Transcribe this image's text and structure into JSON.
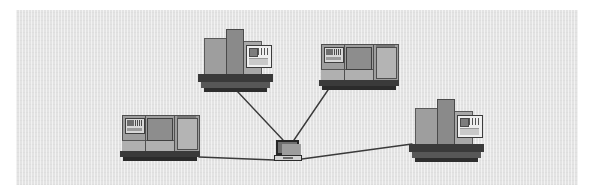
{
  "canvas": {
    "width": 592,
    "height": 195,
    "background_color": "#ffffff",
    "panel": {
      "x": 16,
      "y": 10,
      "width": 562,
      "height": 175,
      "fill_color": "#e3e3e3",
      "texture": "fine-vertical-hatch"
    }
  },
  "diagram": {
    "title": "",
    "type": "star-network",
    "hub_name": "laptop-hub",
    "link_color": "#3a3a3a",
    "link_width": 1.4,
    "node_count": 5,
    "link_count": 4
  },
  "nodes": [
    {
      "id": "machine-top-left",
      "kind": "vertical-machining-center",
      "orientation": "front",
      "x": 198,
      "y": 27,
      "width": 75,
      "height": 66,
      "body_color": "#9e9e9e",
      "column_color": "#8a8a8a",
      "panel_color": "#efefef",
      "base_color": "#3a3a3a"
    },
    {
      "id": "machine-top-right",
      "kind": "cnc-lathe",
      "orientation": "front",
      "x": 319,
      "y": 43,
      "width": 80,
      "height": 48,
      "body_color": "#9e9e9e",
      "window_color": "#8d8d8d",
      "panel_color": "#d8d8d8",
      "base_color": "#3a3a3a"
    },
    {
      "id": "machine-bottom-left",
      "kind": "cnc-lathe",
      "orientation": "front",
      "x": 120,
      "y": 114,
      "width": 80,
      "height": 48,
      "body_color": "#9e9e9e",
      "window_color": "#8d8d8d",
      "panel_color": "#d8d8d8",
      "base_color": "#3a3a3a"
    },
    {
      "id": "machine-bottom-right",
      "kind": "vertical-machining-center",
      "orientation": "front",
      "x": 409,
      "y": 97,
      "width": 75,
      "height": 66,
      "body_color": "#9e9e9e",
      "column_color": "#8a8a8a",
      "panel_color": "#efefef",
      "base_color": "#3a3a3a"
    },
    {
      "id": "laptop-hub",
      "kind": "laptop",
      "x": 274,
      "y": 140,
      "width": 28,
      "height": 22,
      "lid_color": "#6f6f6f",
      "screen_color": "#9d9d9d",
      "deck_color": "#d2d2d2"
    }
  ],
  "links": [
    {
      "id": "link-top-left",
      "from": "machine-top-left",
      "to": "laptop-hub",
      "x1": 237,
      "y1": 91,
      "x2": 283,
      "y2": 140
    },
    {
      "id": "link-top-right",
      "from": "machine-top-right",
      "to": "laptop-hub",
      "x1": 328,
      "y1": 90,
      "x2": 294,
      "y2": 140
    },
    {
      "id": "link-bottom-left",
      "from": "machine-bottom-left",
      "to": "laptop-hub",
      "x1": 199,
      "y1": 157,
      "x2": 274,
      "y2": 160
    },
    {
      "id": "link-bottom-right",
      "from": "machine-bottom-right",
      "to": "laptop-hub",
      "x1": 302,
      "y1": 159,
      "x2": 412,
      "y2": 144
    }
  ]
}
